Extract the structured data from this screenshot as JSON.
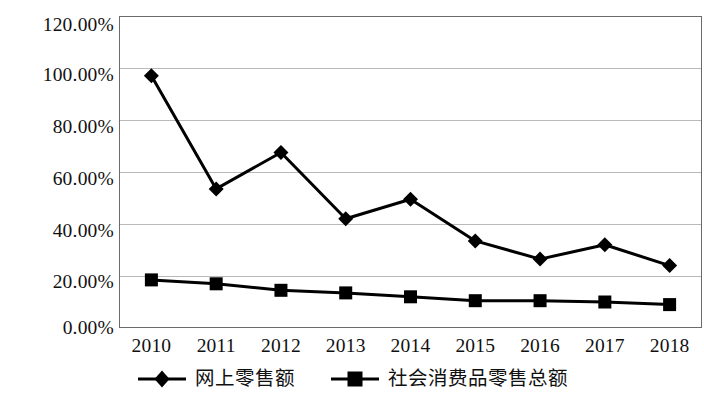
{
  "chart_data": {
    "type": "line",
    "title": "",
    "subtitle": "",
    "xlabel": "",
    "ylabel": "",
    "categories": [
      "2010",
      "2011",
      "2012",
      "2013",
      "2014",
      "2015",
      "2016",
      "2017",
      "2018"
    ],
    "series": [
      {
        "name": "网上零售额",
        "marker": "diamond",
        "color": "#000000",
        "values": [
          97.0,
          53.5,
          67.5,
          42.0,
          49.5,
          33.5,
          26.5,
          32.0,
          24.0
        ]
      },
      {
        "name": "社会消费品零售总额",
        "marker": "square",
        "color": "#000000",
        "values": [
          18.5,
          17.0,
          14.5,
          13.5,
          12.0,
          10.5,
          10.5,
          10.0,
          9.0
        ]
      }
    ],
    "ylim": [
      0,
      120
    ],
    "ytick_step": 20,
    "ytick_labels": [
      "0.00%",
      "20.00%",
      "40.00%",
      "60.00%",
      "80.00%",
      "100.00%",
      "120.00%"
    ],
    "ytick_values": [
      0,
      20,
      40,
      60,
      80,
      100,
      120
    ],
    "grid": {
      "horizontal": true,
      "vertical": false,
      "color": "#b9b9b9"
    },
    "legend": {
      "position": "bottom",
      "entries": [
        "网上零售额",
        "社会消费品零售总额"
      ]
    },
    "axis": {
      "frame": true,
      "frame_color": "#6b6b6b",
      "background": "#ffffff"
    },
    "units": "percent"
  }
}
